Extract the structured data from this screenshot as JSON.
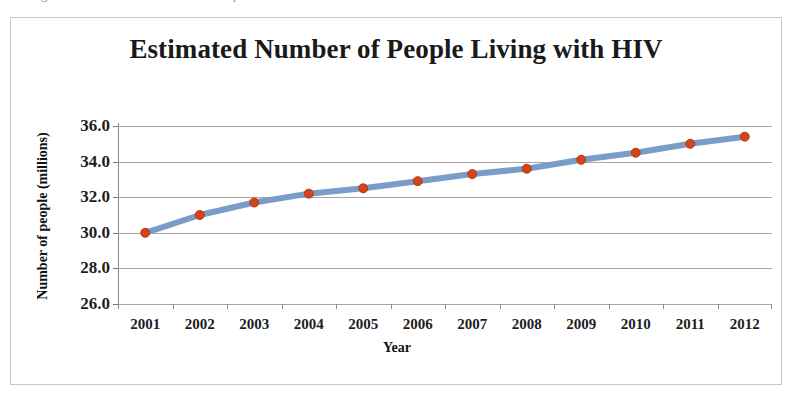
{
  "clipped_top_text": "the figure below shows the trend over the period",
  "figure": {
    "title": "Estimated Number of People Living with HIV",
    "border_color": "#c9c9c9",
    "background": "#ffffff"
  },
  "chart_data": {
    "type": "line",
    "title": "Estimated Number of People Living with HIV",
    "xlabel": "Year",
    "ylabel": "Number of people (millions)",
    "categories": [
      "2001",
      "2002",
      "2003",
      "2004",
      "2005",
      "2006",
      "2007",
      "2008",
      "2009",
      "2010",
      "2011",
      "2012"
    ],
    "x": [
      2001,
      2002,
      2003,
      2004,
      2005,
      2006,
      2007,
      2008,
      2009,
      2010,
      2011,
      2012
    ],
    "values": [
      30.0,
      31.0,
      31.7,
      32.2,
      32.5,
      32.9,
      33.3,
      33.6,
      34.1,
      34.5,
      35.0,
      35.4
    ],
    "series": [
      {
        "name": "People living with HIV (millions)",
        "values": [
          30.0,
          31.0,
          31.7,
          32.2,
          32.5,
          32.9,
          33.3,
          33.6,
          34.1,
          34.5,
          35.0,
          35.4
        ],
        "line_color": "#7a9cc8",
        "marker_color": "#d4441c",
        "marker_edge_color": "#b03a16"
      }
    ],
    "ylim": [
      26.0,
      36.0
    ],
    "y_ticks": [
      "26.0",
      "28.0",
      "30.0",
      "32.0",
      "34.0",
      "36.0"
    ],
    "y_tick_values": [
      26.0,
      28.0,
      30.0,
      32.0,
      34.0,
      36.0
    ],
    "grid": true,
    "grid_axis": "y",
    "grid_color": "#a6a6a6",
    "legend": false,
    "legend_position": "none",
    "line_width_px": 6,
    "marker_size_px": 9
  }
}
